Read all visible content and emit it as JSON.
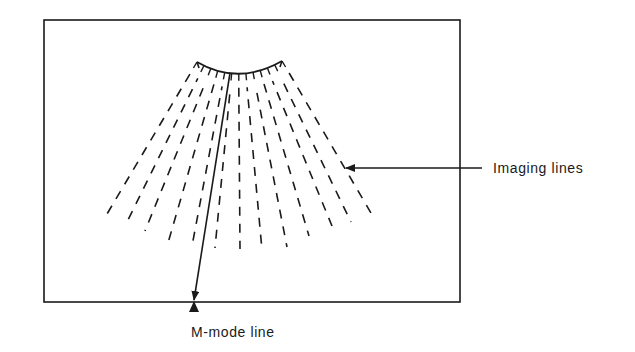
{
  "figure": {
    "colors": {
      "ink": "#1a1a1a",
      "background": "#ffffff"
    },
    "frame": {
      "x": 44,
      "y": 20,
      "width": 416,
      "height": 282
    },
    "transducer_arc": {
      "left": [
        197,
        62
      ],
      "right": [
        282,
        61
      ],
      "bottom": [
        232,
        73
      ]
    },
    "apex": [
      239,
      -10
    ],
    "imaging_line_ends": [
      [
        107,
        214
      ],
      [
        127,
        222
      ],
      [
        145,
        231
      ],
      [
        168,
        243
      ],
      [
        192,
        246
      ],
      [
        215,
        248
      ],
      [
        240,
        249
      ],
      [
        262,
        250
      ],
      [
        287,
        247
      ],
      [
        309,
        236
      ],
      [
        332,
        226
      ],
      [
        351,
        222
      ],
      [
        371,
        213
      ]
    ],
    "m_mode_line": {
      "start": [
        230,
        73
      ],
      "end": [
        194,
        300
      ]
    },
    "labels": {
      "imaging_lines": "Imaging lines",
      "m_mode_line": "M-mode line"
    },
    "imaging_arrow": {
      "from": [
        482,
        168
      ],
      "to": [
        346,
        168
      ]
    }
  }
}
